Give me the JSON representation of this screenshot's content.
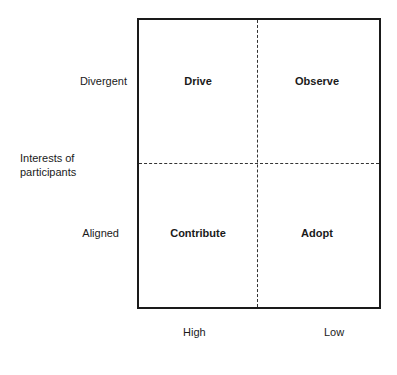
{
  "diagram": {
    "type": "2x2 matrix",
    "y_axis": {
      "title": "Interests of participants",
      "title_lines": [
        "Interests of",
        "participants"
      ],
      "top_label": "Divergent",
      "bottom_label": "Aligned"
    },
    "x_axis": {
      "left_label": "High",
      "right_label": "Low"
    },
    "quadrants": {
      "top_left": "Drive",
      "top_right": "Observe",
      "bottom_left": "Contribute",
      "bottom_right": "Adopt"
    }
  }
}
